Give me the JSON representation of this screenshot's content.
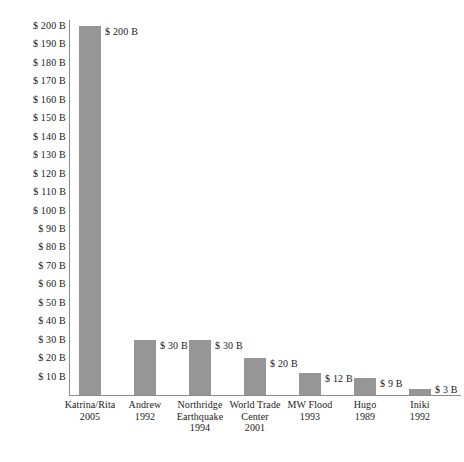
{
  "chart_data": {
    "type": "bar",
    "title": "",
    "subtitle": "",
    "xlabel": "",
    "ylabel": "",
    "orientation": "vertical",
    "grid": false,
    "legend": null,
    "legend_position": "none",
    "bar_color": "#969696",
    "axis_color": "#8d8d8d",
    "text_color": "#1b1b1b",
    "value_unit": "$ B",
    "ylim": [
      0,
      205
    ],
    "ytick_step": 10,
    "ytick_labels": [
      "$ 200 B",
      "$ 190 B",
      "$ 180 B",
      "$ 170 B",
      "$ 160 B",
      "$ 150 B",
      "$ 140 B",
      "$ 130 B",
      "$ 120 B",
      "$ 110 B",
      "$ 100 B",
      "$ 90 B",
      "$ 80 B",
      "$ 70 B",
      "$ 60 B",
      "$ 50 B",
      "$ 40 B",
      "$ 30 B",
      "$ 20 B",
      "$ 10 B"
    ],
    "ytick_values": [
      200,
      190,
      180,
      170,
      160,
      150,
      140,
      130,
      120,
      110,
      100,
      90,
      80,
      70,
      60,
      50,
      40,
      30,
      20,
      10
    ],
    "categories": [
      "Katrina/Rita 2005",
      "Andrew 1992",
      "Northridge Earthquake 1994",
      "World Trade Center 2001",
      "MW Flood 1993",
      "Hugo 1989",
      "Iniki 1992"
    ],
    "category_lines": [
      [
        "Katrina/Rita",
        "2005"
      ],
      [
        "Andrew",
        "1992"
      ],
      [
        "Northridge",
        "Earthquake",
        "1994"
      ],
      [
        "World Trade",
        "Center",
        "2001"
      ],
      [
        "MW Flood",
        "1993"
      ],
      [
        "Hugo",
        "1989"
      ],
      [
        "Iniki",
        "1992"
      ]
    ],
    "values": [
      200,
      30,
      30,
      20,
      12,
      9,
      3
    ],
    "data_labels": [
      "$ 200 B",
      "$ 30 B",
      "$ 30 B",
      "$ 20 B",
      "$ 12 B",
      "$ 9 B",
      "$ 3 B"
    ]
  }
}
